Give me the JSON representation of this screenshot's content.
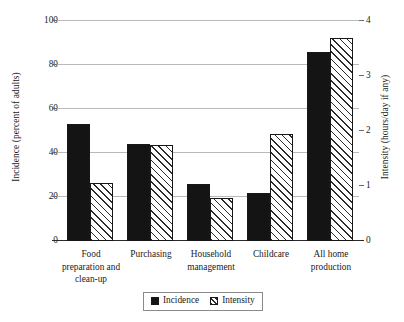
{
  "chart_data": {
    "type": "bar",
    "title": "",
    "subtitle": "",
    "xlabel": "",
    "ylabel": "Incidence (percent of adults)",
    "y2label": "Intensity (hours/day if any)",
    "categories": [
      "Food preparation and clean-up",
      "Purchasing",
      "Household management",
      "Childcare",
      "All home production"
    ],
    "series": [
      {
        "name": "Incidence",
        "axis": "left",
        "unit": "percent of adults",
        "style": "solid-black",
        "values": [
          53,
          44,
          26,
          22,
          86
        ]
      },
      {
        "name": "Intensity",
        "axis": "right",
        "unit": "hours/day if any",
        "style": "diagonal-hatch",
        "values": [
          1.05,
          1.75,
          0.78,
          1.95,
          3.7
        ]
      }
    ],
    "ylim": [
      0,
      100
    ],
    "y2lim": [
      0,
      4
    ],
    "yticks": [
      0,
      20,
      40,
      60,
      80,
      100
    ],
    "y2ticks": [
      0,
      1,
      2,
      3,
      4
    ],
    "ytick_labels": [
      "0",
      "20",
      "40",
      "60",
      "80",
      "100"
    ],
    "y2tick_labels": [
      "0",
      "1",
      "2",
      "3",
      "4"
    ],
    "grid": "horizontal",
    "legend_position": "bottom-center",
    "legend_entries": [
      "Incidence",
      "Intensity"
    ],
    "annotations": [],
    "colors": {
      "incidence": "#141414",
      "intensity_hatch": "#2b2b2b",
      "intensity_fill": "#ffffff",
      "gridline": "#b9b9b9",
      "axis": "#2b2b2b",
      "text": "#1a1a1a",
      "background": "#ffffff"
    }
  },
  "axes": {
    "left": {
      "title": "Incidence (percent of adults)",
      "ticks": [
        {
          "label": "100",
          "value": 100
        },
        {
          "label": "80",
          "value": 80
        },
        {
          "label": "60",
          "value": 60
        },
        {
          "label": "40",
          "value": 40
        },
        {
          "label": "20",
          "value": 20
        },
        {
          "label": "0",
          "value": 0
        }
      ]
    },
    "right": {
      "title": "Intensity (hours/day if any)",
      "ticks": [
        {
          "label": "4",
          "value": 4
        },
        {
          "label": "3",
          "value": 3
        },
        {
          "label": "2",
          "value": 2
        },
        {
          "label": "1",
          "value": 1
        },
        {
          "label": "0",
          "value": 0
        }
      ]
    }
  },
  "categories": [
    {
      "line1": "Food",
      "line2": "preparation and",
      "line3": "clean-up"
    },
    {
      "line1": "Purchasing",
      "line2": "",
      "line3": ""
    },
    {
      "line1": "Household",
      "line2": "management",
      "line3": ""
    },
    {
      "line1": "Childcare",
      "line2": "",
      "line3": ""
    },
    {
      "line1": "All home",
      "line2": "production",
      "line3": ""
    }
  ],
  "legend": {
    "incidence_label": "Incidence",
    "intensity_label": "Intensity"
  }
}
